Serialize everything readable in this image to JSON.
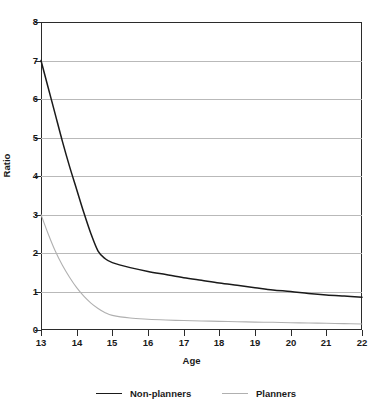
{
  "chart_data": {
    "type": "line",
    "title": "",
    "xlabel": "Age",
    "ylabel": "Ratio",
    "xlim": [
      13,
      22
    ],
    "ylim": [
      0,
      8
    ],
    "grid": true,
    "legend_position": "bottom",
    "x_ticks": [
      "13",
      "14",
      "15",
      "16",
      "17",
      "18",
      "19",
      "20",
      "21",
      "22"
    ],
    "y_ticks": [
      "0",
      "1",
      "2",
      "3",
      "4",
      "5",
      "6",
      "7",
      "8"
    ],
    "x": [
      13,
      13.2,
      13.4,
      13.6,
      13.8,
      14,
      14.2,
      14.4,
      14.6,
      14.8,
      15,
      15.5,
      16,
      16.5,
      17,
      17.5,
      18,
      18.5,
      19,
      19.5,
      20,
      20.5,
      21,
      21.5,
      22
    ],
    "series": [
      {
        "name": "Non-planners",
        "color": "#1a1a1a",
        "values": [
          7.0,
          6.3,
          5.6,
          4.9,
          4.25,
          3.65,
          3.05,
          2.5,
          2.05,
          1.85,
          1.75,
          1.62,
          1.52,
          1.44,
          1.36,
          1.29,
          1.22,
          1.16,
          1.1,
          1.04,
          1.0,
          0.95,
          0.91,
          0.88,
          0.85
        ]
      },
      {
        "name": "Planners",
        "color": "#b0b0b0",
        "values": [
          3.0,
          2.5,
          2.05,
          1.68,
          1.37,
          1.1,
          0.88,
          0.7,
          0.56,
          0.45,
          0.38,
          0.31,
          0.28,
          0.26,
          0.245,
          0.235,
          0.225,
          0.215,
          0.205,
          0.2,
          0.19,
          0.18,
          0.175,
          0.165,
          0.155
        ]
      }
    ],
    "legend": [
      {
        "label": "Non-planners",
        "color": "#1a1a1a"
      },
      {
        "label": "Planners",
        "color": "#b0b0b0"
      }
    ]
  },
  "axes": {
    "y_title": "Ratio",
    "x_title": "Age",
    "y_labels": [
      "8",
      "7",
      "6",
      "5",
      "4",
      "3",
      "2",
      "1",
      "0"
    ],
    "x_labels": [
      "13",
      "14",
      "15",
      "16",
      "17",
      "18",
      "19",
      "20",
      "21",
      "22"
    ]
  },
  "colors": {
    "non_planners": "#1a1a1a",
    "planners": "#b0b0b0",
    "grid": "#b9b9b9",
    "frame": "#2b2b2b",
    "background": "#ffffff"
  }
}
